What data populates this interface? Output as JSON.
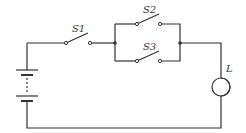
{
  "diagram": {
    "type": "circuit",
    "components": {
      "switch_s1": {
        "label": "S1"
      },
      "switch_s2": {
        "label": "S2"
      },
      "switch_s3": {
        "label": "S3"
      },
      "lamp": {
        "label": "L"
      },
      "battery": {
        "label": ""
      }
    },
    "connections": "Battery in series with S1, then S2 and S3 in parallel, then lamp L"
  }
}
